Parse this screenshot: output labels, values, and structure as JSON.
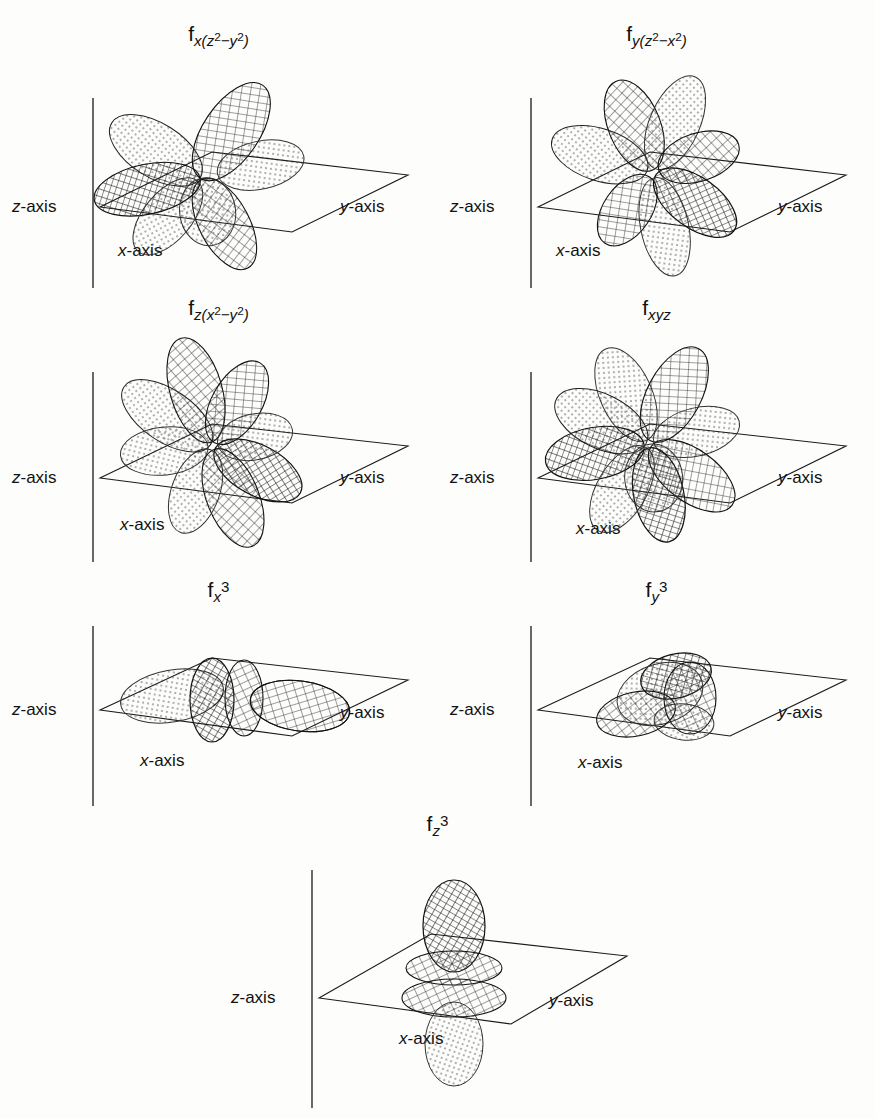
{
  "figure": {
    "kind": "f-orbital-boundary-surface-diagrams",
    "background_color": "#fdfdfb",
    "ink_color": "#1a1a1a",
    "axis_label_z": "z-axis",
    "axis_label_x": "x-axis",
    "axis_label_y": "y-axis"
  },
  "panels": [
    {
      "id": "fx-z2-y2",
      "title_plain": "f x(z²−y²)",
      "base": "f",
      "sub_prefix": "x(",
      "sub_terms": [
        "z",
        "2",
        "−",
        "y",
        "2"
      ],
      "sub_suffix": ")",
      "lobes": 6,
      "row": 1,
      "col": 1,
      "axes": {
        "z": "z-axis",
        "x": "x-axis",
        "y": "y-axis"
      }
    },
    {
      "id": "fy-z2-x2",
      "title_plain": "f y(z²−x²)",
      "base": "f",
      "sub_prefix": "y(",
      "sub_terms": [
        "z",
        "2",
        "−",
        "x",
        "2"
      ],
      "sub_suffix": ")",
      "lobes": 6,
      "row": 1,
      "col": 2,
      "axes": {
        "z": "z-axis",
        "x": "x-axis",
        "y": "y-axis"
      }
    },
    {
      "id": "fz-x2-y2",
      "title_plain": "f z(x²−y²)",
      "base": "f",
      "sub_prefix": "z(",
      "sub_terms": [
        "x",
        "2",
        "−",
        "y",
        "2"
      ],
      "sub_suffix": ")",
      "lobes": 8,
      "row": 2,
      "col": 1,
      "axes": {
        "z": "z-axis",
        "x": "x-axis",
        "y": "y-axis"
      }
    },
    {
      "id": "fxyz",
      "title_plain": "f xyz",
      "base": "f",
      "sub_prefix": "xyz",
      "sub_terms": [],
      "sub_suffix": "",
      "lobes": 8,
      "row": 2,
      "col": 2,
      "axes": {
        "z": "z-axis",
        "x": "x-axis",
        "y": "y-axis"
      }
    },
    {
      "id": "fx3",
      "title_plain": "f x3",
      "base": "f",
      "sub_prefix": "x",
      "sub_terms": [],
      "sub_suffix": "",
      "exponent": "3",
      "lobes": 2,
      "rings": 2,
      "row": 3,
      "col": 1,
      "axes": {
        "z": "z-axis",
        "x": "x-axis",
        "y": "y-axis"
      }
    },
    {
      "id": "fy3",
      "title_plain": "f y3",
      "base": "f",
      "sub_prefix": "y",
      "sub_terms": [],
      "sub_suffix": "",
      "exponent": "3",
      "lobes": 2,
      "rings": 2,
      "row": 3,
      "col": 2,
      "axes": {
        "z": "z-axis",
        "x": "x-axis",
        "y": "y-axis"
      }
    },
    {
      "id": "fz3",
      "title_plain": "f z3",
      "base": "f",
      "sub_prefix": "z",
      "sub_terms": [],
      "sub_suffix": "",
      "exponent": "3",
      "lobes": 2,
      "rings": 2,
      "row": 4,
      "col": 1,
      "axes": {
        "z": "z-axis",
        "x": "x-axis",
        "y": "y-axis"
      }
    }
  ]
}
